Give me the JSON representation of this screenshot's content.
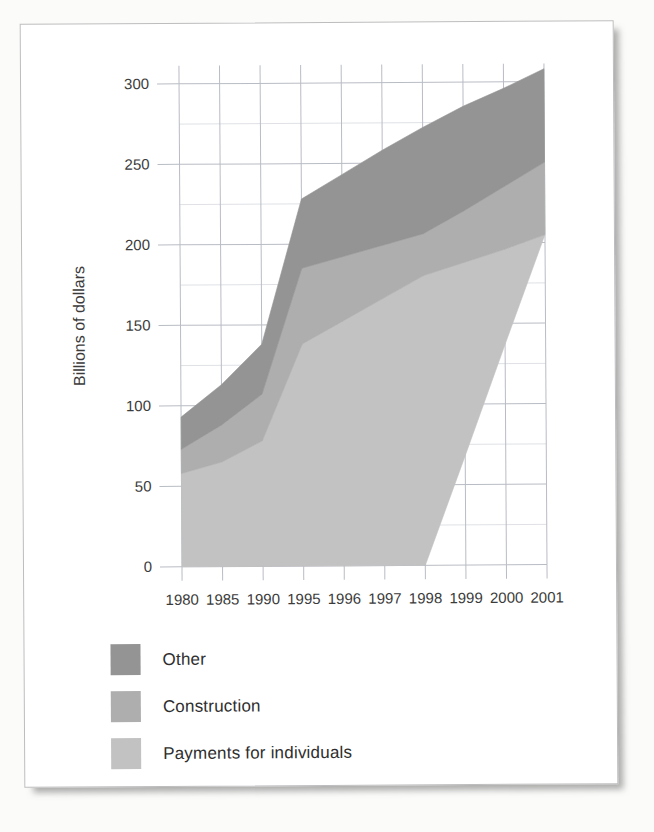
{
  "chart_data": {
    "type": "area",
    "stacked": true,
    "title": "",
    "xlabel": "",
    "ylabel": "Billions of dollars",
    "categories": [
      "1980",
      "1985",
      "1990",
      "1995",
      "1996",
      "1997",
      "1998",
      "1999",
      "2000",
      "2001"
    ],
    "ylim": [
      0,
      300
    ],
    "ytick_values": [
      0,
      50,
      100,
      150,
      200,
      250,
      300
    ],
    "ytick_labels": [
      "0",
      "50",
      "100",
      "150",
      "200",
      "250",
      "300"
    ],
    "grid_step": 25,
    "grid": true,
    "legend_position": "below-left",
    "baseline": [
      0,
      0,
      0,
      0,
      0,
      0,
      0,
      68,
      137,
      205
    ],
    "series": [
      {
        "name": "Payments for individuals",
        "color": "#c2c2c2",
        "cumulative_top": [
          58,
          65,
          78,
          138,
          152,
          166,
          180,
          188,
          196,
          205
        ],
        "values": [
          58,
          65,
          78,
          138,
          152,
          166,
          180,
          120,
          59,
          0
        ]
      },
      {
        "name": "Construction",
        "color": "#aeaeae",
        "cumulative_top": [
          73,
          88,
          107,
          185,
          192,
          199,
          206,
          220,
          235,
          250
        ],
        "values": [
          15,
          23,
          29,
          47,
          40,
          33,
          26,
          32,
          39,
          45
        ]
      },
      {
        "name": "Other",
        "color": "#949494",
        "cumulative_top": [
          93,
          113,
          138,
          228,
          243,
          258,
          272,
          285,
          296,
          308
        ],
        "values": [
          20,
          25,
          31,
          43,
          51,
          59,
          66,
          65,
          61,
          58
        ]
      }
    ]
  },
  "legend": {
    "items": [
      {
        "label": "Other",
        "color": "#949494"
      },
      {
        "label": "Construction",
        "color": "#aeaeae"
      },
      {
        "label": "Payments for individuals",
        "color": "#c2c2c2"
      }
    ]
  },
  "axes": {
    "y_title": "Billions of dollars"
  }
}
